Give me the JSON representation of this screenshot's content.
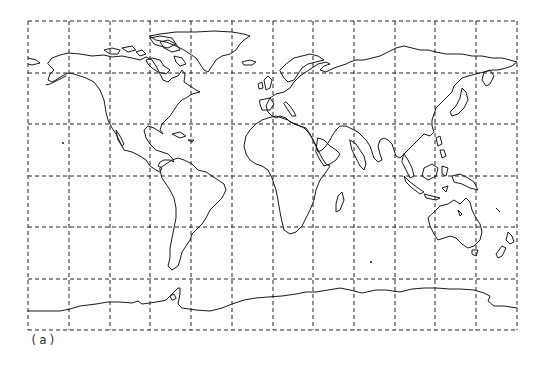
{
  "figure": {
    "caption": "(a)",
    "type": "world-map",
    "projection": "equirectangular-like",
    "line_color": "#1a1a1a",
    "background": "#ffffff"
  },
  "grid": {
    "style": "dashed",
    "columns": 12,
    "rows": 6,
    "left": 28,
    "right": 517,
    "top": 21,
    "bottom": 330,
    "x_lines": [
      28,
      69,
      110,
      150,
      191,
      232,
      273,
      313,
      354,
      395,
      435,
      476,
      517
    ],
    "y_lines": [
      21,
      73,
      124,
      176,
      227,
      279,
      330
    ]
  },
  "landmasses": [
    "north-america",
    "greenland",
    "canadian-arctic-islands",
    "south-america",
    "europe",
    "africa",
    "madagascar",
    "asia",
    "japan",
    "southeast-asia",
    "indonesia",
    "australia",
    "new-zealand",
    "antarctica",
    "iceland",
    "british-isles"
  ]
}
